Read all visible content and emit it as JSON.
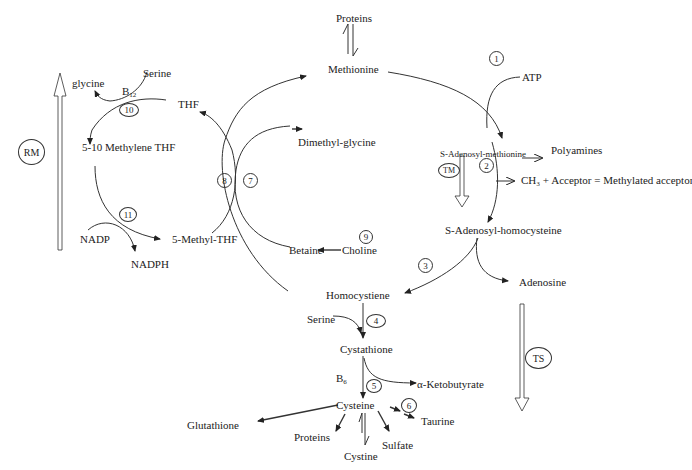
{
  "diagram": {
    "type": "metabolic-pathway",
    "nodes": {
      "proteins_top": "Proteins",
      "methionine": "Methionine",
      "atp": "ATP",
      "sam": "S-Adenosyl-methionine",
      "polyamines": "Polyamines",
      "methylation": "CH₃ + Acceptor = Methylated acceptor",
      "sah": "S-Adenosyl-homocysteine",
      "adenosine": "Adenosine",
      "homocysteine": "Homocystiene",
      "serine_bottom": "Serine",
      "cystathione": "Cystathione",
      "b6": "B",
      "b6_sub": "6",
      "ketobutyrate": "α-Ketobutyrate",
      "cysteine": "Cysteine",
      "taurine": "Taurine",
      "sulfate": "Sulfate",
      "cystine": "Cystine",
      "proteins_bottom": "Proteins",
      "glutathione": "Glutathione",
      "betaine": "Betaine",
      "choline": "Choline",
      "dimethylglycine": "Dimethyl-glycine",
      "thf": "THF",
      "methyl_thf": "5-Methyl-THF",
      "methylene_thf": "5-10 Methylene THF",
      "glycine": "glycine",
      "serine_top": "Serine",
      "b12": "B",
      "b12_sub": "12",
      "nadp": "NADP",
      "nadph": "NADPH"
    },
    "enzymes": [
      "1",
      "2",
      "3",
      "4",
      "5",
      "6",
      "7",
      "8",
      "9",
      "10",
      "11"
    ],
    "pathways": {
      "rm": "RM",
      "tm": "TM",
      "ts": "TS"
    }
  }
}
